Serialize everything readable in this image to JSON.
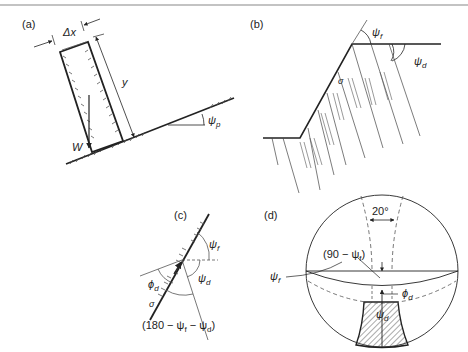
{
  "figure": {
    "panels": [
      {
        "id": "a",
        "label": "(a)",
        "annotations": {
          "dx": "Δx",
          "y": "y",
          "weight": "W",
          "angle": "ψ",
          "angle_sub": "p"
        }
      },
      {
        "id": "b",
        "label": "(b)",
        "annotations": {
          "face_angle": "ψ",
          "face_sub": "f",
          "dip_angle": "ψ",
          "dip_sub": "d",
          "stress": "σ"
        }
      },
      {
        "id": "c",
        "label": "(c)",
        "annotations": {
          "psi_f": "ψ",
          "psi_f_sub": "f",
          "psi_d": "ψ",
          "psi_d_sub": "d",
          "phi_d": "ϕ",
          "phi_d_sub": "d",
          "sigma": "σ",
          "expr": "(180 − ψ",
          "expr_f": "f",
          "expr_mid": " − ψ",
          "expr_d": "d",
          "expr_end": ")"
        }
      },
      {
        "id": "d",
        "label": "(d)",
        "annotations": {
          "angle_20": "20°",
          "ninety": "(90 − ψ",
          "ninety_sub": "f",
          "ninety_end": ")",
          "phi_d": "ϕ",
          "phi_d_sub": "d",
          "psi_d": "ψ",
          "psi_d_sub": "d",
          "psi_f": "ψ",
          "psi_f_sub": "f"
        }
      }
    ]
  },
  "colors": {
    "ink": "#222222",
    "rule": "#888888"
  }
}
